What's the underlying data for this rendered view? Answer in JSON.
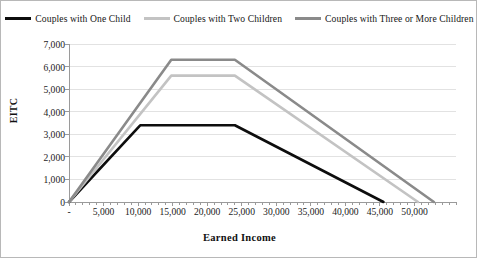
{
  "chart_data": {
    "type": "line",
    "title": "",
    "xlabel": "Earned Income",
    "ylabel": "EITC",
    "xlim": [
      0,
      56000
    ],
    "ylim": [
      0,
      7000
    ],
    "grid": true,
    "legend_position": "top",
    "xticks": [
      0,
      5000,
      10000,
      15000,
      20000,
      25000,
      30000,
      35000,
      40000,
      45000,
      50000
    ],
    "xticklabels": [
      "-",
      "5,000",
      "10,000",
      "15,000",
      "20,000",
      "25,000",
      "30,000",
      "35,000",
      "40,000",
      "45,000",
      "50,000"
    ],
    "yticks": [
      0,
      1000,
      2000,
      3000,
      4000,
      5000,
      6000,
      7000
    ],
    "yticklabels": [
      "0",
      "1,000",
      "2,000",
      "3,000",
      "4,000",
      "5,000",
      "6,000",
      "7,000"
    ],
    "minor_xtick_step": 1000,
    "series": [
      {
        "name": "Couples with One Child",
        "color": "#0d0d0d",
        "width": 2.6,
        "x": [
          0,
          10300,
          24000,
          45500
        ],
        "y": [
          0,
          3400,
          3400,
          0
        ]
      },
      {
        "name": "Couples with Two Children",
        "color": "#c3c3c3",
        "width": 2.6,
        "x": [
          0,
          14800,
          24000,
          50500
        ],
        "y": [
          0,
          5600,
          5600,
          0
        ]
      },
      {
        "name": "Couples with Three or More Children",
        "color": "#8a8a8a",
        "width": 2.6,
        "x": [
          0,
          14800,
          24000,
          52800
        ],
        "y": [
          0,
          6300,
          6300,
          0
        ]
      }
    ]
  },
  "legend": {
    "items": [
      {
        "label": "Couples with One Child",
        "color": "#0d0d0d"
      },
      {
        "label": "Couples with Two Children",
        "color": "#c3c3c3"
      },
      {
        "label": "Couples with Three or More Children",
        "color": "#8a8a8a"
      }
    ]
  },
  "axes": {
    "x_title": "Earned Income",
    "y_title": "EITC"
  },
  "colors": {
    "grid": "#e2e2e2",
    "axis": "#9a9a9a",
    "border": "#b8b8b8",
    "text": "#1c1c1c"
  }
}
